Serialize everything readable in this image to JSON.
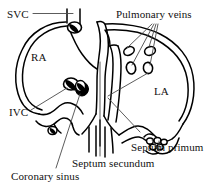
{
  "figure": {
    "background_color": "#ffffff",
    "stroke_color": "#000000",
    "leader_color": "#555555",
    "width": 221,
    "height": 192
  },
  "labels": {
    "svc": "SVC",
    "pulmonary_veins": "Pulmonary veins",
    "ra": "RA",
    "la": "LA",
    "ivc": "IVC",
    "septum_primum": "Septum primum",
    "septum_secundum": "Septum secundum",
    "coronary_sinus": "Coronary sinus"
  },
  "structures": [
    {
      "name": "superior-vena-cava",
      "label": "SVC",
      "kind": "vessel"
    },
    {
      "name": "right-atrium",
      "label": "RA",
      "kind": "chamber"
    },
    {
      "name": "left-atrium",
      "label": "LA",
      "kind": "chamber"
    },
    {
      "name": "inferior-vena-cava",
      "label": "IVC",
      "kind": "vessel"
    },
    {
      "name": "pulmonary-veins",
      "label": "Pulmonary veins",
      "kind": "vessel-openings",
      "count": 4
    },
    {
      "name": "septum-primum",
      "label": "Septum primum",
      "kind": "septum"
    },
    {
      "name": "septum-secundum",
      "label": "Septum secundum",
      "kind": "septum"
    },
    {
      "name": "coronary-sinus",
      "label": "Coronary sinus",
      "kind": "vessel-opening"
    }
  ]
}
